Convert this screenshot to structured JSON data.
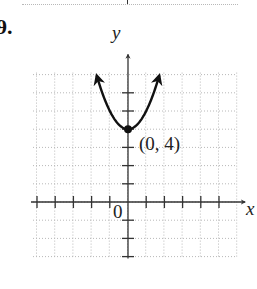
{
  "problem": {
    "label": "9."
  },
  "chart_data": {
    "type": "line",
    "title": "",
    "xlabel": "x",
    "ylabel": "y",
    "origin_label": "0",
    "xlim": [
      -5,
      5
    ],
    "ylim": [
      -3,
      7
    ],
    "grid": true,
    "grid_style": "dotted",
    "function": "y = x^2 + 4",
    "series": [
      {
        "name": "parabola",
        "x": [
          -1.75,
          -1.5,
          -1,
          -0.5,
          0,
          0.5,
          1,
          1.5,
          1.75
        ],
        "y": [
          7.06,
          6.25,
          5,
          4.25,
          4,
          4.25,
          5,
          6.25,
          7.06
        ],
        "arrows_at_ends": true
      }
    ],
    "annotations": [
      {
        "text": "(0, 4)",
        "x": 0,
        "y": 4,
        "marker": "filled-dot"
      }
    ],
    "x_ticks": [
      -5,
      -4,
      -3,
      -2,
      -1,
      1,
      2,
      3,
      4,
      5
    ],
    "y_ticks": [
      -3,
      -2,
      -1,
      1,
      2,
      3,
      4,
      5,
      6
    ]
  },
  "labels": {
    "y_axis": "y",
    "x_axis": "x",
    "origin": "0",
    "vertex": "(0, 4)"
  },
  "colors": {
    "curve": "#111111",
    "axis": "#333333",
    "grid": "#b8b8b8"
  }
}
